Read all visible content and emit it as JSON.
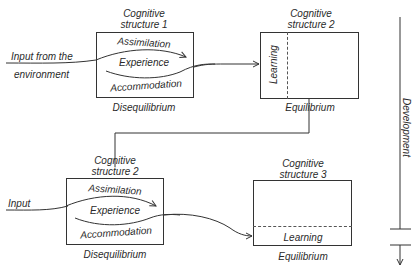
{
  "diagram": {
    "top_row": {
      "input_label_line1": "Input from the",
      "input_label_line2": "environment",
      "structure1": {
        "title_line1": "Cognitive",
        "title_line2": "structure 1",
        "assimilation": "Assimilation",
        "experience": "Experience",
        "accommodation": "Accommodation",
        "state": "Disequilibrium"
      },
      "structure2": {
        "title_line1": "Cognitive",
        "title_line2": "structure 2",
        "learning": "Learning",
        "state": "Equilibrium"
      }
    },
    "bottom_row": {
      "input_label": "Input",
      "structure2": {
        "title_line1": "Cognitive",
        "title_line2": "structure 2",
        "assimilation": "Assimilation",
        "experience": "Experience",
        "accommodation": "Accommodation",
        "state": "Disequilibrium"
      },
      "structure3": {
        "title_line1": "Cognitive",
        "title_line2": "structure 3",
        "learning": "Learning",
        "state": "Equilibrium"
      }
    },
    "axis": {
      "label": "Development"
    },
    "colors": {
      "line": "#333333",
      "text": "#2a2a2a",
      "background": "#ffffff"
    }
  }
}
